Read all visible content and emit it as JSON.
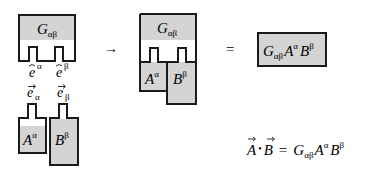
{
  "colors": {
    "fill": "#d4d4d4",
    "stroke": "#1a1a1a",
    "background": "#ffffff"
  },
  "diagram": {
    "metric_block": {
      "symbol": "G",
      "subscript": "αβ"
    },
    "basis_upper": [
      {
        "symbol": "e",
        "index": "α"
      },
      {
        "symbol": "e",
        "index": "β"
      }
    ],
    "basis_lower": [
      {
        "symbol": "e",
        "index": "α"
      },
      {
        "symbol": "e",
        "index": "β"
      }
    ],
    "vector_a": {
      "symbol": "A",
      "superscript": "α"
    },
    "vector_b": {
      "symbol": "B",
      "superscript": "β"
    },
    "arrow": "→",
    "equals": "=",
    "combined": {
      "g_symbol": "G",
      "g_sub": "αβ",
      "a_symbol": "A",
      "a_sup": "α",
      "b_symbol": "B",
      "b_sup": "β"
    },
    "result_box": {
      "g_symbol": "G",
      "g_sub": "αβ",
      "a_symbol": "A",
      "a_sup": "α",
      "b_symbol": "B",
      "b_sup": "β"
    },
    "formula": {
      "lhs_a": "A",
      "dot": "•",
      "lhs_b": "B",
      "equals": "=",
      "g_symbol": "G",
      "g_sub": "αβ",
      "a_symbol": "A",
      "a_sup": "α",
      "b_symbol": "B",
      "b_sup": "β"
    }
  }
}
